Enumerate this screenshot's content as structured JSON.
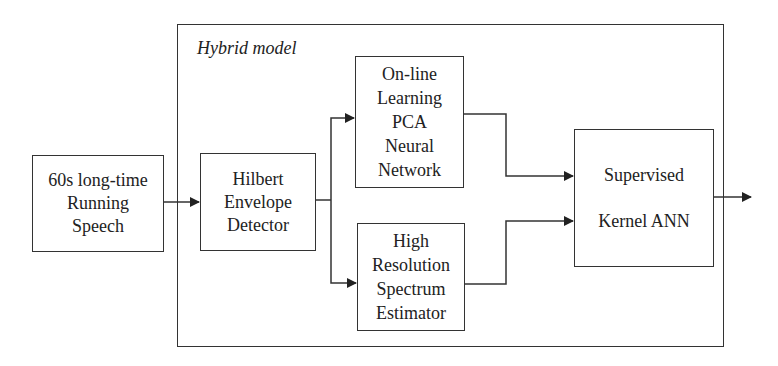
{
  "container": {
    "title": "Hybrid model"
  },
  "blocks": {
    "input": {
      "lines": [
        "60s long-time",
        "Running",
        "Speech"
      ]
    },
    "hilbert": {
      "lines": [
        "Hilbert",
        "Envelope",
        "Detector"
      ]
    },
    "pca": {
      "lines": [
        "On-line",
        "Learning",
        "PCA",
        "Neural",
        "Network"
      ]
    },
    "spectrum": {
      "lines": [
        "High",
        "Resolution",
        "Spectrum",
        "Estimator"
      ]
    },
    "kernel": {
      "lines": [
        "Supervised",
        "",
        "Kernel ANN"
      ]
    }
  },
  "connections": [
    {
      "from": "input",
      "to": "hilbert"
    },
    {
      "from": "hilbert",
      "to": "pca"
    },
    {
      "from": "hilbert",
      "to": "spectrum"
    },
    {
      "from": "pca",
      "to": "kernel"
    },
    {
      "from": "spectrum",
      "to": "kernel"
    },
    {
      "from": "kernel",
      "to": "output"
    }
  ]
}
